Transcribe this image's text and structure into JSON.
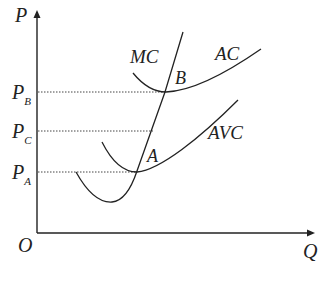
{
  "diagram": {
    "axes": {
      "y_label": "P",
      "x_label": "Q",
      "origin_label": "O"
    },
    "price_levels": [
      {
        "id": "PB",
        "label": "P",
        "sub": "B"
      },
      {
        "id": "PC",
        "label": "P",
        "sub": "C"
      },
      {
        "id": "PA",
        "label": "P",
        "sub": "A"
      }
    ],
    "curves": {
      "mc": "MC",
      "ac": "AC",
      "avc": "AVC"
    },
    "points": {
      "a": "A",
      "b": "B"
    },
    "colors": {
      "line": "#222222",
      "dotted": "#444444"
    }
  }
}
